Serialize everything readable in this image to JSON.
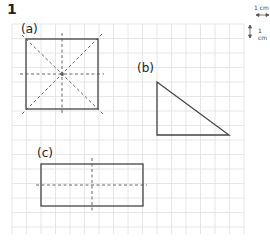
{
  "question_number": "1",
  "scale": {
    "horizontal_label": "1 cm",
    "vertical_label": "1 cm"
  },
  "figures": [
    {
      "label": "(a)",
      "shape": "square",
      "lines_of_symmetry": 4
    },
    {
      "label": "(b)",
      "shape": "right-triangle",
      "lines_of_symmetry": 0
    },
    {
      "label": "(c)",
      "shape": "rectangle",
      "lines_of_symmetry": 2
    }
  ],
  "colors": {
    "grid": "#e4e4e4",
    "outline": "#444444",
    "dashed": "#555555"
  }
}
